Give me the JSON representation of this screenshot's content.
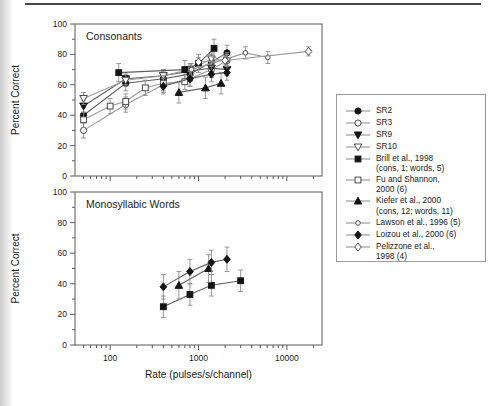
{
  "figure": {
    "x_axis_label": "Rate (pulses/s/channel)",
    "y_axis_label": "Percent Correct",
    "x_tick_labels": [
      "100",
      "1000",
      "10000"
    ],
    "y_tick_labels": [
      "0",
      "20",
      "40",
      "60",
      "80",
      "100"
    ],
    "frame_color": "#5a5a5a",
    "line_color_filled": "#5f5f5f",
    "line_color_open": "#9a9a9a",
    "marker_fill": "#151515",
    "error_bar_color": "#8c8c8c"
  },
  "legend": {
    "items": [
      {
        "key": "sr2",
        "lines": [
          "SR2"
        ],
        "marker": "circle",
        "filled": true
      },
      {
        "key": "sr3",
        "lines": [
          "SR3"
        ],
        "marker": "circle",
        "filled": false
      },
      {
        "key": "sr9",
        "lines": [
          "SR9"
        ],
        "marker": "triangle-down",
        "filled": true
      },
      {
        "key": "sr10",
        "lines": [
          "SR10"
        ],
        "marker": "triangle-down",
        "filled": false
      },
      {
        "key": "brill",
        "lines": [
          "Brill et al., 1998",
          "(cons, 1; words, 5)"
        ],
        "marker": "square",
        "filled": true
      },
      {
        "key": "fu-shannon",
        "lines": [
          "Fu and Shannon,",
          "2000 (6)"
        ],
        "marker": "square",
        "filled": false
      },
      {
        "key": "kiefer",
        "lines": [
          "Kiefer et al., 2000",
          "(cons, 12; words, 11)"
        ],
        "marker": "triangle-up",
        "filled": true
      },
      {
        "key": "lawson",
        "lines": [
          "Lawson et al., 1996 (5)"
        ],
        "marker": "circle-small",
        "filled": false
      },
      {
        "key": "loizou",
        "lines": [
          "Loizou et al., 2000 (6)"
        ],
        "marker": "diamond",
        "filled": true
      },
      {
        "key": "pelizzone",
        "lines": [
          "Pelizzone et al.,",
          "1998 (4)"
        ],
        "marker": "diamond",
        "filled": false
      }
    ]
  },
  "chart_data": [
    {
      "type": "line",
      "title": "Consonants",
      "xlabel": "Rate (pulses/s/channel)",
      "ylabel": "Percent Correct",
      "x_scale": "log",
      "xlim": [
        40,
        25000
      ],
      "ylim": [
        0,
        100
      ],
      "grid": false,
      "legend_position": "outside-right",
      "series": [
        {
          "name": "SR2",
          "marker": "circle",
          "filled": true,
          "x": [
            50,
            150,
            400,
            800,
            1400,
            2100
          ],
          "y": [
            40,
            61,
            64,
            67,
            75,
            81
          ],
          "yerr": 5
        },
        {
          "name": "SR3",
          "marker": "circle",
          "filled": false,
          "x": [
            50,
            150,
            400,
            800,
            1400,
            2100
          ],
          "y": [
            30,
            47,
            60,
            64,
            70,
            76
          ],
          "yerr": 5
        },
        {
          "name": "SR9",
          "marker": "triangle-down",
          "filled": true,
          "x": [
            50,
            150,
            400,
            800,
            1400,
            2100
          ],
          "y": [
            46,
            64,
            66,
            69,
            71,
            70
          ],
          "yerr": 4
        },
        {
          "name": "SR10",
          "marker": "triangle-down",
          "filled": false,
          "x": [
            50,
            150,
            400,
            800,
            1400,
            2100
          ],
          "y": [
            51,
            63,
            66,
            70,
            77,
            76
          ],
          "yerr": 4
        },
        {
          "name": "Brill et al., 1998",
          "marker": "square",
          "filled": true,
          "x": [
            125,
            700,
            1000,
            1500
          ],
          "y": [
            68,
            70,
            74,
            84
          ],
          "yerr": 6
        },
        {
          "name": "Fu and Shannon, 2000",
          "marker": "square",
          "filled": false,
          "x": [
            50,
            100,
            150,
            250,
            400,
            700
          ],
          "y": [
            37,
            46,
            49,
            58,
            61,
            62
          ],
          "yerr": 5
        },
        {
          "name": "Kiefer et al., 2000",
          "marker": "triangle-up",
          "filled": true,
          "x": [
            600,
            1200,
            1800
          ],
          "y": [
            55,
            58,
            61
          ],
          "yerr": 7
        },
        {
          "name": "Lawson et al., 1996",
          "marker": "circle-small",
          "filled": false,
          "x": [
            833,
            3400,
            6100
          ],
          "y": [
            70,
            81,
            78
          ],
          "yerr": 4
        },
        {
          "name": "Loizou et al., 2000",
          "marker": "diamond",
          "filled": true,
          "x": [
            400,
            800,
            1400,
            2100
          ],
          "y": [
            59,
            64,
            67,
            68
          ],
          "yerr": 5
        },
        {
          "name": "Pelizzone et al., 1998",
          "marker": "diamond",
          "filled": false,
          "x": [
            1000,
            2000,
            17600
          ],
          "y": [
            75,
            76,
            82
          ],
          "yerr": 3
        }
      ]
    },
    {
      "type": "line",
      "title": "Monosyllabic Words",
      "xlabel": "Rate (pulses/s/channel)",
      "ylabel": "Percent Correct",
      "x_scale": "log",
      "xlim": [
        40,
        25000
      ],
      "ylim": [
        0,
        100
      ],
      "grid": false,
      "series": [
        {
          "name": "Brill et al., 1998",
          "marker": "square",
          "filled": true,
          "x": [
            400,
            800,
            1400,
            3000
          ],
          "y": [
            25,
            33,
            39,
            42
          ],
          "yerr": 7
        },
        {
          "name": "Kiefer et al., 2000",
          "marker": "triangle-up",
          "filled": true,
          "x": [
            600,
            1300
          ],
          "y": [
            39,
            50
          ],
          "yerr": 9
        },
        {
          "name": "Loizou et al., 2000",
          "marker": "diamond",
          "filled": true,
          "x": [
            400,
            800,
            1400,
            2100
          ],
          "y": [
            38,
            48,
            54,
            56
          ],
          "yerr": 8
        }
      ]
    }
  ]
}
